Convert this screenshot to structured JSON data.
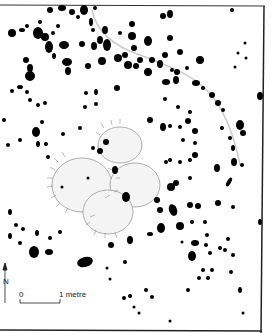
{
  "figure": {
    "type": "archaeological site plan",
    "north_label": "N",
    "scale_start": "0",
    "scale_end": "1 metre"
  }
}
